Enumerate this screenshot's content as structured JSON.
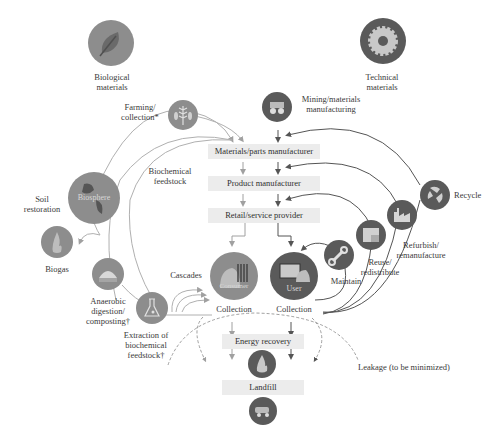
{
  "diagram": {
    "title_left": {
      "line1": "Biological",
      "line2": "materials",
      "icon": "leaf-icon"
    },
    "title_right": {
      "line1": "Technical",
      "line2": "materials",
      "icon": "gear-icon"
    },
    "process_boxes": [
      {
        "label": "Materials/parts manufacturer"
      },
      {
        "label": "Product manufacturer"
      },
      {
        "label": "Retail/service provider"
      },
      {
        "label": "Energy recovery"
      },
      {
        "label": "Landfill"
      }
    ],
    "biological_nodes": {
      "farming": {
        "line1": "Farming/",
        "line2": "collection*",
        "icon": "wheat-icon"
      },
      "biochemical_feedstock": {
        "line1": "Biochemical",
        "line2": "feedstock"
      },
      "soil_restoration": {
        "line1": "Soil",
        "line2": "restoration"
      },
      "biosphere": {
        "label": "Biosphere",
        "icon": "globe-icon"
      },
      "biogas": {
        "label": "Biogas",
        "icon": "flame-icon"
      },
      "anaerobic": {
        "line1": "Anaerobic",
        "line2": "digestion/",
        "line3": "composting†",
        "icon": "greenhouse-icon"
      },
      "extraction": {
        "line1": "Extraction of",
        "line2": "biochemical",
        "line3": "feedstock†",
        "icon": "flask-icon"
      },
      "cascades": {
        "label": "Cascades"
      },
      "consumer": {
        "label": "Consumer",
        "caption": "Collection",
        "icon": "consumer-icon"
      }
    },
    "technical_nodes": {
      "mining": {
        "line1": "Mining/materials",
        "line2": "manufacturing",
        "icon": "mining-truck-icon"
      },
      "recycle": {
        "label": "Recycle",
        "icon": "recycle-icon"
      },
      "refurbish": {
        "line1": "Refurbish/",
        "line2": "remanufacture",
        "icon": "factory-icon"
      },
      "reuse": {
        "line1": "Reuse/",
        "line2": "redistribute",
        "icon": "boxes-icon"
      },
      "maintain": {
        "label": "Maintain",
        "icon": "wrench-icon"
      },
      "user": {
        "label": "User",
        "caption": "Collection",
        "icon": "computer-icon"
      }
    },
    "leakage": {
      "label": "Leakage (to be minimized)"
    },
    "colors": {
      "biological_circle": "#8d8d8d",
      "technical_circle": "#5a5a5a",
      "box_fill": "#ececec",
      "bio_line": "#a8a8a8",
      "tech_line": "#555555"
    }
  }
}
